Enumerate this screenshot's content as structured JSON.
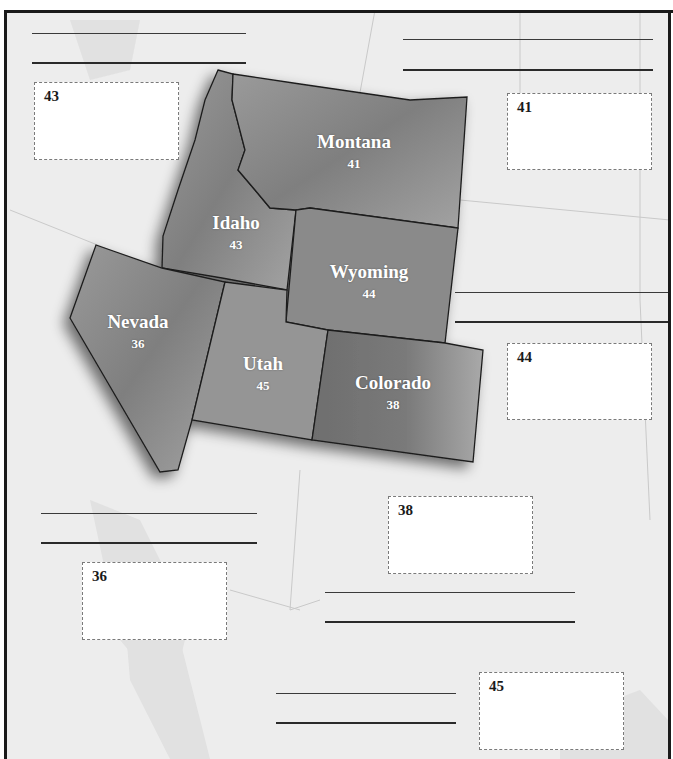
{
  "map": {
    "region": "Mountain West",
    "colors": {
      "background": "#ededed",
      "state_fill": "#8f8f8f",
      "state_border": "#1e1e1e",
      "box_border": "#7a7a7a",
      "line": "#3a3a3a"
    },
    "states": [
      {
        "name": "Montana",
        "page": "41"
      },
      {
        "name": "Idaho",
        "page": "43"
      },
      {
        "name": "Wyoming",
        "page": "44"
      },
      {
        "name": "Nevada",
        "page": "36"
      },
      {
        "name": "Utah",
        "page": "45"
      },
      {
        "name": "Colorado",
        "page": "38"
      }
    ],
    "answer_boxes": [
      {
        "number": "43"
      },
      {
        "number": "41"
      },
      {
        "number": "44"
      },
      {
        "number": "38"
      },
      {
        "number": "36"
      },
      {
        "number": "45"
      }
    ]
  }
}
